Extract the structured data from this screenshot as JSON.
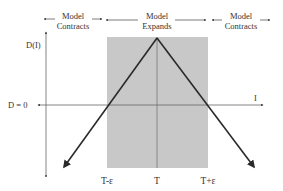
{
  "regions": {
    "left": {
      "line1": "Model",
      "line2": "Contracts"
    },
    "center": {
      "line1": "Model",
      "line2": "Expands"
    },
    "right": {
      "line1": "Model",
      "line2": "Contracts"
    }
  },
  "axes": {
    "y_label": "D(I)",
    "x_label": "I",
    "zero_label": "D = 0"
  },
  "ticks": {
    "left": "T-ε",
    "center": "T",
    "right": "T+ε"
  },
  "colors": {
    "shaded_region": "#c8c8c8",
    "line": "#2a2a2a",
    "axis": "#555555",
    "text": "#333333"
  }
}
